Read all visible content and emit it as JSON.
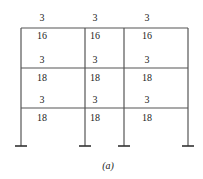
{
  "caption": "(a)",
  "frame": {
    "stories": 3,
    "bays": 3,
    "beam_labels": [
      {
        "level": "roof",
        "top": [
          "3",
          "3",
          "3"
        ],
        "bottom": [
          "16",
          "16",
          "16"
        ]
      },
      {
        "level": "floor-2",
        "top": [
          "3",
          "3",
          "3"
        ],
        "bottom": [
          "18",
          "18",
          "18"
        ]
      },
      {
        "level": "floor-1",
        "top": [
          "3",
          "3",
          "3"
        ],
        "bottom": [
          "18",
          "18",
          "18"
        ]
      }
    ]
  }
}
